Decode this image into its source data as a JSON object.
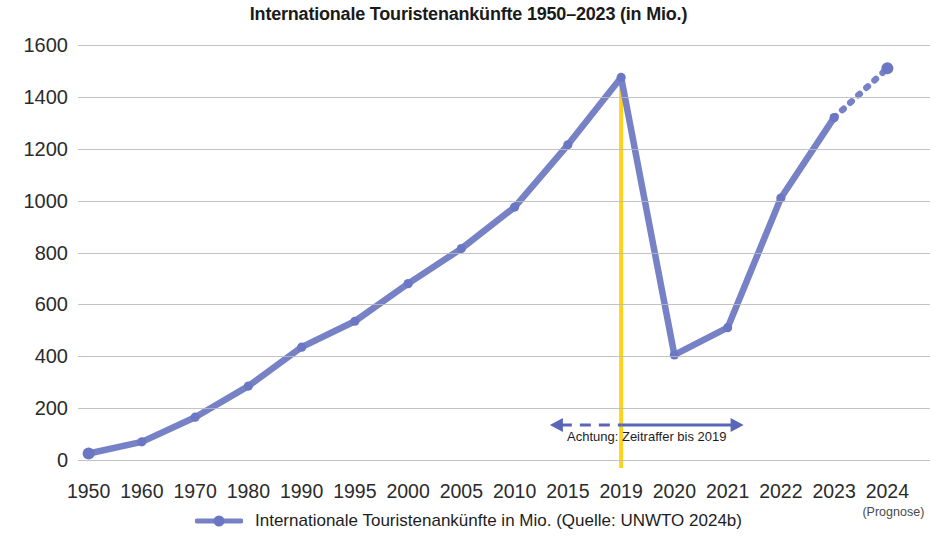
{
  "chart_data": {
    "type": "line",
    "title": "Internationale Touristenankünfte 1950–2023 (in Mio.)",
    "xlabel": "",
    "ylabel": "",
    "ylim": [
      0,
      1600
    ],
    "ytick_step": 200,
    "grid": true,
    "legend_position": "bottom",
    "categories": [
      "1950",
      "1960",
      "1970",
      "1980",
      "1990",
      "1995",
      "2000",
      "2005",
      "2010",
      "2015",
      "2019",
      "2020",
      "2021",
      "2022",
      "2023",
      "2024"
    ],
    "values": [
      25,
      70,
      165,
      285,
      435,
      535,
      680,
      815,
      975,
      1215,
      1475,
      405,
      510,
      1010,
      1320,
      1510
    ],
    "yticks": [
      "0",
      "200",
      "400",
      "600",
      "800",
      "1000",
      "1200",
      "1400",
      "1600"
    ],
    "series": [
      {
        "name": "Internationale Touristenankünfte in Mio. (Quelle: UNWTO 2024b)",
        "color": "#7782c6",
        "values": [
          25,
          70,
          165,
          285,
          435,
          535,
          680,
          815,
          975,
          1215,
          1475,
          405,
          510,
          1010,
          1320,
          1510
        ],
        "forecast_from_index": 14
      }
    ],
    "annotations": [
      {
        "name": "time-lapse-note",
        "text": "Achtung: Zeitraffer bis 2019",
        "from_category": "2015",
        "to_category": "2021",
        "style": "double-arrow"
      },
      {
        "name": "pandemic-marker",
        "text": "",
        "at_category": "2019",
        "color": "#ffd21e",
        "style": "vertical-line"
      },
      {
        "name": "forecast-note",
        "text": "(Prognose)",
        "at_category": "2024"
      }
    ]
  },
  "chart": {
    "title": "Internationale Touristenankünfte 1950–2023 (in Mio.)",
    "yticks": [
      "1600",
      "1400",
      "1200",
      "1000",
      "800",
      "600",
      "400",
      "200",
      "0"
    ],
    "xticks": [
      "1950",
      "1960",
      "1970",
      "1980",
      "1990",
      "1995",
      "2000",
      "2005",
      "2010",
      "2015",
      "2019",
      "2020",
      "2021",
      "2022",
      "2023",
      "2024"
    ],
    "forecast_sublabel": "(Prognose)",
    "annotation_text": "Achtung: Zeitraffer bis 2019",
    "legend_label": "Internationale Touristenankünfte in Mio. (Quelle: UNWTO 2024b)",
    "colors": {
      "line": "#7782c6",
      "marker": "#6b77c4",
      "grid": "#b9b9bd",
      "marker_line": "#ffd21e",
      "annotation_arrow": "#5a66b8",
      "text": "#231f20"
    }
  }
}
